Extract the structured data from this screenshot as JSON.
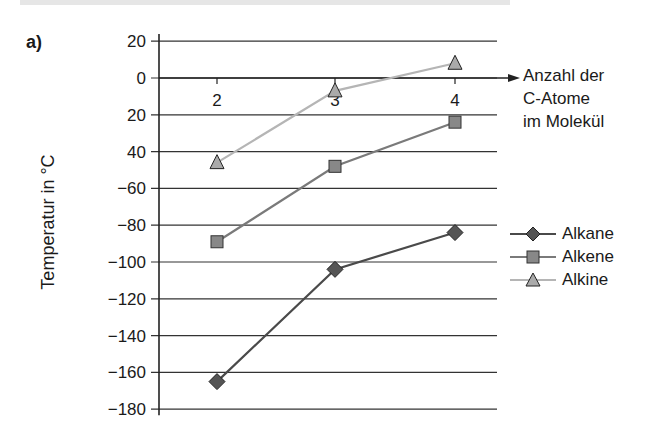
{
  "panel_label": "a)",
  "chart_data": {
    "type": "line",
    "title": "",
    "xlabel": "Anzahl der\nC-Atome\nim Molekül",
    "ylabel": "Temperatur in °C",
    "x": [
      2,
      3,
      4
    ],
    "y_ticks": [
      20,
      0,
      -20,
      -40,
      -60,
      -80,
      -100,
      -120,
      -140,
      -160,
      -180
    ],
    "y_tick_labels": [
      "20",
      "0",
      "20",
      "40",
      "-60",
      "-80",
      "-100",
      "-120",
      "-140",
      "-160",
      "-180"
    ],
    "ylim": [
      -180,
      20
    ],
    "grid": true,
    "legend_position": "right",
    "series": [
      {
        "name": "Alkane",
        "marker": "diamond",
        "color": "#4a4a4a",
        "values": [
          -165,
          -104,
          -84
        ]
      },
      {
        "name": "Alkene",
        "marker": "square",
        "color": "#7a7a7a",
        "values": [
          -89,
          -48,
          -24
        ]
      },
      {
        "name": "Alkine",
        "marker": "triangle",
        "color": "#b5b5b5",
        "values": [
          -46,
          -7,
          8
        ]
      }
    ]
  },
  "legend": {
    "items": [
      {
        "label": "Alkane"
      },
      {
        "label": "Alkene"
      },
      {
        "label": "Alkine"
      }
    ]
  }
}
